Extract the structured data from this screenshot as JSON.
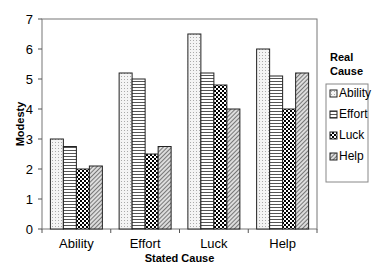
{
  "chart_data": {
    "type": "bar",
    "title": "",
    "xlabel": "Stated Cause",
    "ylabel": "Modesty",
    "ylim": [
      0,
      7
    ],
    "yticks": [
      "0",
      "1",
      "2",
      "3",
      "4",
      "5",
      "6",
      "7"
    ],
    "categories": [
      "Ability",
      "Effort",
      "Luck",
      "Help"
    ],
    "legend_title": "Real Cause",
    "legend_position": "right",
    "grid": false,
    "series": [
      {
        "name": "Ability",
        "values": [
          3.0,
          5.2,
          6.5,
          6.0
        ]
      },
      {
        "name": "Effort",
        "values": [
          2.75,
          5.0,
          5.2,
          5.1
        ]
      },
      {
        "name": "Luck",
        "values": [
          2.0,
          2.5,
          4.8,
          4.0
        ]
      },
      {
        "name": "Help",
        "values": [
          2.1,
          2.75,
          4.0,
          5.2
        ]
      }
    ]
  }
}
